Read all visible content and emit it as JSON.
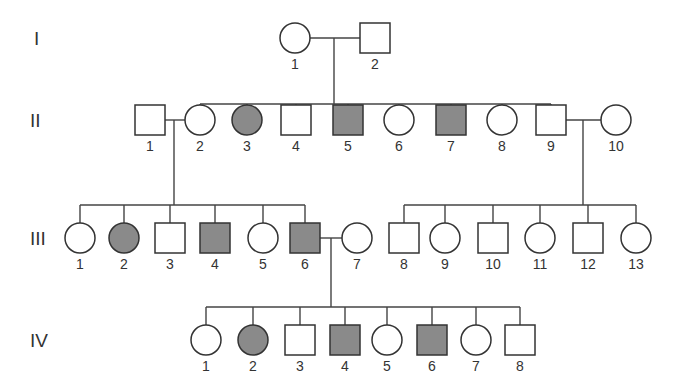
{
  "diagram": {
    "type": "pedigree",
    "colors": {
      "affected": "#8a8a8a",
      "unaffected": "#ffffff",
      "line": "#444444"
    },
    "generations": [
      {
        "label": "I",
        "y": 38,
        "label_x": 34,
        "individuals": [
          {
            "id": "1",
            "sex": "female",
            "affected": false,
            "x": 295
          },
          {
            "id": "2",
            "sex": "male",
            "affected": false,
            "x": 375
          }
        ]
      },
      {
        "label": "II",
        "y": 120,
        "label_x": 30,
        "individuals": [
          {
            "id": "1",
            "sex": "male",
            "affected": false,
            "x": 150
          },
          {
            "id": "2",
            "sex": "female",
            "affected": false,
            "x": 200
          },
          {
            "id": "3",
            "sex": "female",
            "affected": true,
            "x": 247
          },
          {
            "id": "4",
            "sex": "male",
            "affected": false,
            "x": 296
          },
          {
            "id": "5",
            "sex": "male",
            "affected": true,
            "x": 348
          },
          {
            "id": "6",
            "sex": "female",
            "affected": false,
            "x": 399
          },
          {
            "id": "7",
            "sex": "male",
            "affected": true,
            "x": 451
          },
          {
            "id": "8",
            "sex": "female",
            "affected": false,
            "x": 502
          },
          {
            "id": "9",
            "sex": "male",
            "affected": false,
            "x": 551
          },
          {
            "id": "10",
            "sex": "female",
            "affected": false,
            "x": 616
          }
        ]
      },
      {
        "label": "III",
        "y": 238,
        "label_x": 30,
        "individuals": [
          {
            "id": "1",
            "sex": "female",
            "affected": false,
            "x": 80
          },
          {
            "id": "2",
            "sex": "female",
            "affected": true,
            "x": 124
          },
          {
            "id": "3",
            "sex": "male",
            "affected": false,
            "x": 170
          },
          {
            "id": "4",
            "sex": "male",
            "affected": true,
            "x": 215
          },
          {
            "id": "5",
            "sex": "female",
            "affected": false,
            "x": 263
          },
          {
            "id": "6",
            "sex": "male",
            "affected": true,
            "x": 305
          },
          {
            "id": "7",
            "sex": "female",
            "affected": false,
            "x": 357
          },
          {
            "id": "8",
            "sex": "male",
            "affected": false,
            "x": 404
          },
          {
            "id": "9",
            "sex": "female",
            "affected": false,
            "x": 445
          },
          {
            "id": "10",
            "sex": "male",
            "affected": false,
            "x": 493
          },
          {
            "id": "11",
            "sex": "female",
            "affected": false,
            "x": 540
          },
          {
            "id": "12",
            "sex": "male",
            "affected": false,
            "x": 588
          },
          {
            "id": "13",
            "sex": "female",
            "affected": false,
            "x": 636
          }
        ]
      },
      {
        "label": "IV",
        "y": 340,
        "label_x": 30,
        "individuals": [
          {
            "id": "1",
            "sex": "female",
            "affected": false,
            "x": 206
          },
          {
            "id": "2",
            "sex": "female",
            "affected": true,
            "x": 253
          },
          {
            "id": "3",
            "sex": "male",
            "affected": false,
            "x": 300
          },
          {
            "id": "4",
            "sex": "male",
            "affected": true,
            "x": 345
          },
          {
            "id": "5",
            "sex": "female",
            "affected": false,
            "x": 387
          },
          {
            "id": "6",
            "sex": "male",
            "affected": true,
            "x": 432
          },
          {
            "id": "7",
            "sex": "female",
            "affected": false,
            "x": 476
          },
          {
            "id": "8",
            "sex": "male",
            "affected": false,
            "x": 520
          }
        ]
      }
    ],
    "matings": [
      {
        "gen": 0,
        "a": 0,
        "b": 1,
        "drop_x": 334,
        "sibship_gen": 1,
        "sibship_y": 104,
        "children": [
          1,
          2,
          3,
          4,
          5,
          6,
          7,
          8
        ]
      },
      {
        "gen": 1,
        "a": 0,
        "b": 1,
        "drop_x": 174,
        "sibship_gen": 2,
        "sibship_y": 205,
        "children": [
          0,
          1,
          2,
          3,
          4,
          5
        ]
      },
      {
        "gen": 1,
        "a": 8,
        "b": 9,
        "drop_x": 583,
        "sibship_gen": 2,
        "sibship_y": 205,
        "children": [
          7,
          8,
          9,
          10,
          11,
          12
        ]
      },
      {
        "gen": 2,
        "a": 5,
        "b": 6,
        "drop_x": 331,
        "sibship_gen": 3,
        "sibship_y": 307,
        "children": [
          0,
          1,
          2,
          3,
          4,
          5,
          6,
          7
        ]
      }
    ]
  }
}
